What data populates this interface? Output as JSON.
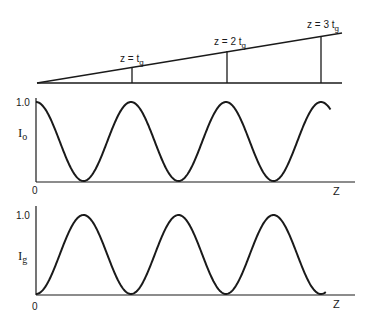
{
  "figure": {
    "top_diagram": {
      "markers": [
        {
          "label": "z = t",
          "sub": "g",
          "x": 132
        },
        {
          "label": "z = 2 t",
          "sub": "g",
          "x": 227
        },
        {
          "label": "z = 3 t",
          "sub": "g",
          "x": 321
        }
      ]
    },
    "plots": [
      {
        "id": "Io",
        "ylabel": "I",
        "ylabel_sub": "o",
        "ytick": "1.0",
        "origin": "0",
        "xlabel": "Z",
        "phase": "cos"
      },
      {
        "id": "Ig",
        "ylabel": "I",
        "ylabel_sub": "g",
        "ytick": "1.0",
        "origin": "0",
        "xlabel": "Z",
        "phase": "sin"
      }
    ],
    "color": "#1a1a1a"
  },
  "chart_data": [
    {
      "type": "line",
      "title": "",
      "ylabel": "Io",
      "xlabel": "Z",
      "ylim": [
        0,
        1.0
      ],
      "x_units": "t_g",
      "series": [
        {
          "name": "Io",
          "function": "cos^2(pi*z/t_g)",
          "x": [
            0,
            0.5,
            1,
            1.5,
            2,
            2.5,
            3,
            3.1
          ],
          "values": [
            1.0,
            0,
            1.0,
            0,
            1.0,
            0,
            1.0,
            0.9
          ]
        }
      ]
    },
    {
      "type": "line",
      "title": "",
      "ylabel": "Ig",
      "xlabel": "Z",
      "ylim": [
        0,
        1.0
      ],
      "x_units": "t_g",
      "series": [
        {
          "name": "Ig",
          "function": "sin^2(pi*z/t_g)",
          "x": [
            0,
            0.5,
            1,
            1.5,
            2,
            2.5,
            3,
            3.05
          ],
          "values": [
            0,
            1.0,
            0,
            1.0,
            0,
            1.0,
            0,
            0.01
          ]
        }
      ]
    }
  ]
}
